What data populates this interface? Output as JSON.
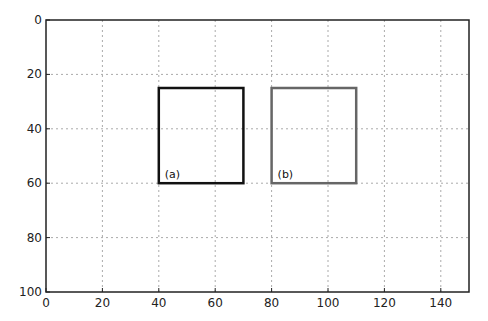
{
  "chart_data": {
    "type": "image-plot",
    "title": "",
    "xlabel": "",
    "ylabel": "",
    "xlim": [
      0,
      150
    ],
    "ylim": [
      100,
      0
    ],
    "y_inverted": true,
    "grid": true,
    "xticks": [
      "0",
      "20",
      "40",
      "60",
      "80",
      "100",
      "120",
      "140"
    ],
    "yticks": [
      "0",
      "20",
      "40",
      "60",
      "80",
      "100"
    ],
    "rectangles": [
      {
        "label": "(a)",
        "x0": 40,
        "y0": 25,
        "x1": 70,
        "y1": 60,
        "color": "#111111"
      },
      {
        "label": "(b)",
        "x0": 80,
        "y0": 25,
        "x1": 110,
        "y1": 60,
        "color": "#666666"
      }
    ]
  }
}
